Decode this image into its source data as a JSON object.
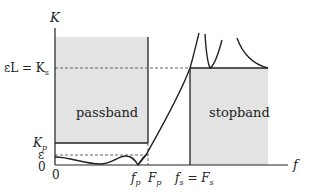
{
  "diagram": {
    "y_axis_label": "K",
    "x_axis_label": "f",
    "y_ticks": {
      "eL_Ks": "εL = K",
      "eL_Ks_sub": "s",
      "Kp": "K",
      "Kp_sub": "p",
      "eps": "ε",
      "zero": "0"
    },
    "x_ticks": {
      "zero": "0",
      "fp": "f",
      "fp_sub": "p",
      "Fp": "F",
      "Fp_sub": "p",
      "fs_Fs_left": "f",
      "fs_Fs_left_sub": "s",
      "fs_Fs_eq": " = F",
      "fs_Fs_right_sub": "s"
    },
    "regions": {
      "passband": "passband",
      "stopband": "stopband"
    },
    "colors": {
      "region_fill": "#e3e3e3",
      "line": "#222222",
      "dashed": "#555555"
    }
  }
}
